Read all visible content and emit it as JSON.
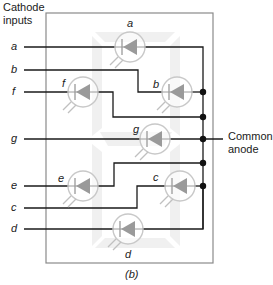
{
  "header": {
    "inputs_label_line1": "Cathode",
    "inputs_label_line2": "inputs"
  },
  "common": {
    "label_line1": "Common",
    "label_line2": "anode"
  },
  "caption": "(b)",
  "inputs": [
    {
      "id": "a",
      "label": "a"
    },
    {
      "id": "b",
      "label": "b"
    },
    {
      "id": "f",
      "label": "f"
    },
    {
      "id": "g",
      "label": "g"
    },
    {
      "id": "e",
      "label": "e"
    },
    {
      "id": "c",
      "label": "c"
    },
    {
      "id": "d",
      "label": "d"
    }
  ],
  "leds": [
    {
      "segment": "a",
      "label": "a"
    },
    {
      "segment": "b",
      "label": "b"
    },
    {
      "segment": "f",
      "label": "f"
    },
    {
      "segment": "g",
      "label": "g"
    },
    {
      "segment": "e",
      "label": "e"
    },
    {
      "segment": "c",
      "label": "c"
    },
    {
      "segment": "d",
      "label": "d"
    }
  ],
  "colors": {
    "wire": "#1a1a1a",
    "frame": "#8a8a8a",
    "led_body": "#9a9a9a",
    "led_circle": "#c8c8c8",
    "segment_bg": "#f0f0f0"
  }
}
